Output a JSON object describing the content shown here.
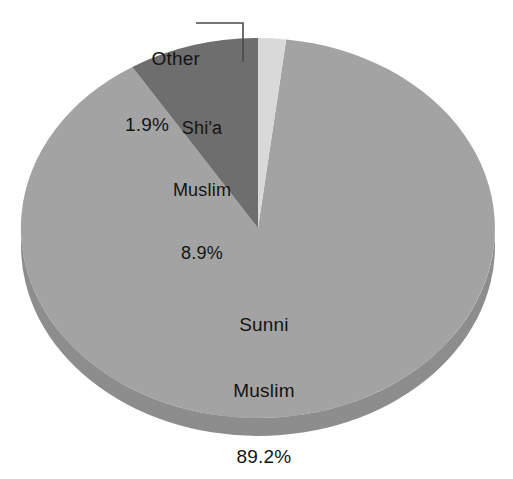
{
  "chart_data": {
    "type": "pie",
    "title": "",
    "subtitle": "",
    "xlabel": "",
    "ylabel": "",
    "legend_position": "none",
    "grid": false,
    "style": "3d-pie",
    "units": "percent",
    "categories": [
      "Sunni Muslim",
      "Shi'a Muslim",
      "Other"
    ],
    "values": [
      89.2,
      8.9,
      1.9
    ],
    "slices": [
      {
        "name": "Sunni Muslim",
        "label_line1": "Sunni",
        "label_line2": "Muslim",
        "value": 89.2,
        "value_label": "89.2%",
        "color": "#a3a3a3",
        "side_color": "#8d8d8d",
        "label_placement": "inside"
      },
      {
        "name": "Shi'a Muslim",
        "label_line1": "Shi'a",
        "label_line2": "Muslim",
        "value": 8.9,
        "value_label": "8.9%",
        "color": "#6e6e6e",
        "side_color": "#5c5c5c",
        "label_placement": "inside"
      },
      {
        "name": "Other",
        "label_line1": "Other",
        "label_line2": "",
        "value": 1.9,
        "value_label": "1.9%",
        "color": "#d9d9d9",
        "side_color": "#bdbdbd",
        "label_placement": "outside-leader"
      }
    ]
  },
  "labels": {
    "other": {
      "name": "Other",
      "percent": "1.9%"
    },
    "shia": {
      "line1": "Shi'a",
      "line2": "Muslim",
      "percent": "8.9%"
    },
    "sunni": {
      "line1": "Sunni",
      "line2": "Muslim",
      "percent": "89.2%"
    }
  },
  "colors": {
    "background": "#ffffff",
    "text": "#141414",
    "leader_line": "#4a4a4a",
    "sunni": "#a3a3a3",
    "shia": "#6e6e6e",
    "other": "#d9d9d9",
    "sunni_side": "#8d8d8d",
    "shia_side": "#5c5c5c",
    "other_side": "#bdbdbd"
  }
}
